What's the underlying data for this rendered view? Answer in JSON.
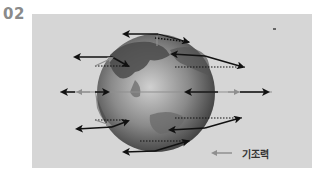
{
  "figure": {
    "number": "02"
  },
  "legend": {
    "label": "기조력",
    "arrow_color": "#8f8f8f"
  },
  "colors": {
    "panel_background": "#d6d6d6",
    "globe_dark": "#3a3a3a",
    "globe_light": "#bdbdbd",
    "arrow_black": "#111111",
    "arrow_gray": "#8f8f8f"
  }
}
